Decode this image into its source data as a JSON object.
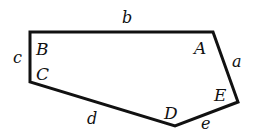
{
  "figure": {
    "type": "pentagon",
    "stroke_color": "#111111",
    "background": "#ffffff",
    "vertices": [
      {
        "name": "A",
        "x": 213,
        "y": 32
      },
      {
        "name": "E",
        "x": 238,
        "y": 102
      },
      {
        "name": "D",
        "x": 175,
        "y": 126
      },
      {
        "name": "C",
        "x": 30,
        "y": 82
      },
      {
        "name": "B",
        "x": 30,
        "y": 32
      }
    ],
    "vertex_labels": {
      "A": "A",
      "B": "B",
      "C": "C",
      "D": "D",
      "E": "E"
    },
    "edge_labels": {
      "a": "a",
      "b": "b",
      "c": "c",
      "d": "d",
      "e": "e"
    }
  }
}
